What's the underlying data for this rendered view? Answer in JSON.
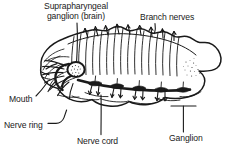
{
  "figure": {
    "background_color": "#ffffff",
    "ink_color": "#1a1a1a"
  },
  "labels": {
    "brain_line1": "Suprapharyngeal",
    "brain_line2": "ganglion (brain)",
    "branch_nerves": "Branch nerves",
    "mouth": "Mouth",
    "nerve_ring": "Nerve ring",
    "nerve_cord": "Nerve cord",
    "ganglion": "Ganglion"
  },
  "structures": [
    {
      "name": "body-outline",
      "description": "segmented worm body, anterior at left"
    },
    {
      "name": "brain",
      "description": "stippled suprapharyngeal ganglion in head"
    },
    {
      "name": "nerve-ring",
      "description": "circumpharyngeal nerve ring behind mouth"
    },
    {
      "name": "ventral-nerve-cord",
      "description": "chain of solid black segmental ganglia"
    },
    {
      "name": "branch-nerves",
      "description": "paired lateral nerves radiating from cord"
    },
    {
      "name": "mouth",
      "description": "anterior opening at left end"
    }
  ]
}
